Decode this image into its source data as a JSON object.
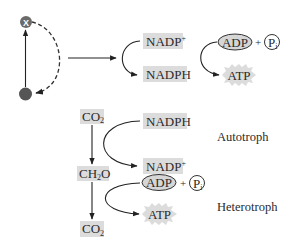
{
  "cycle": {
    "top_node_label": "X",
    "bottom_node_label": "",
    "top_node_color": "#6a6a6a",
    "bottom_node_color": "#555555"
  },
  "top_reactions": {
    "nadp_plus": {
      "base": "NADP",
      "sup": "+"
    },
    "nadph": "NADPH",
    "adp": "ADP",
    "plus": "+",
    "pi": {
      "base": "P",
      "sub": "i"
    },
    "atp": "ATP"
  },
  "autotroph_section": {
    "label": "Autotroph",
    "co2_top": {
      "base": "CO",
      "sub": "2"
    },
    "nadph": "NADPH",
    "nadp_plus": {
      "base": "NADP",
      "sup": "+"
    }
  },
  "middle": {
    "ch2o": {
      "pre": "CH",
      "sub": "2",
      "post": "O"
    }
  },
  "heterotroph_section": {
    "label": "Heterotroph",
    "adp": "ADP",
    "plus": "+",
    "pi": {
      "base": "P",
      "sub": "i"
    },
    "atp": "ATP",
    "co2_bottom": {
      "base": "CO",
      "sub": "2"
    }
  },
  "colors": {
    "box_fill": "#dcdcdc",
    "ellipse_fill": "#d6d6d6",
    "line": "#222222",
    "text": "#2a2a2a"
  }
}
